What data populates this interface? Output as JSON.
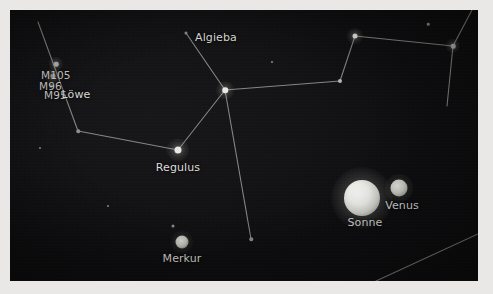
{
  "view": {
    "name": "star-chart",
    "panel": {
      "x": 10,
      "y": 10,
      "width": 468,
      "height": 271
    },
    "background_color": "#111112",
    "line_color": "#9a9a94",
    "label_color": "#dcdcd8",
    "margin_color": "#e9e8e6"
  },
  "labels": [
    {
      "id": "algieba",
      "text": "Algieba",
      "x": 206,
      "y": 22,
      "size": "normal"
    },
    {
      "id": "m105",
      "text": "M105",
      "x": 31,
      "y": 59,
      "size": "small"
    },
    {
      "id": "m96",
      "text": "M96",
      "x": 29,
      "y": 70,
      "size": "small"
    },
    {
      "id": "m95",
      "text": "M95",
      "x": 34,
      "y": 79,
      "size": "small"
    },
    {
      "id": "loewe",
      "text": "Löwe",
      "x": 66,
      "y": 79,
      "size": "normal"
    },
    {
      "id": "regulus",
      "text": "Regulus",
      "x": 168,
      "y": 152,
      "size": "normal"
    },
    {
      "id": "merkur",
      "text": "Merkur",
      "x": 172,
      "y": 243,
      "size": "normal"
    },
    {
      "id": "sonne",
      "text": "Sonne",
      "x": 355,
      "y": 207,
      "size": "normal"
    },
    {
      "id": "venus",
      "text": "Venus",
      "x": 392,
      "y": 190,
      "size": "normal"
    }
  ],
  "objects": {
    "sun": {
      "name": "Sonne",
      "x": 352,
      "y": 188,
      "diameter": 36
    },
    "venus": {
      "name": "Venus",
      "x": 389,
      "y": 178,
      "diameter": 17
    },
    "mercury": {
      "name": "Merkur",
      "x": 172,
      "y": 232,
      "diameter": 13
    }
  },
  "stars": [
    {
      "id": "regulus",
      "x": 168,
      "y": 140,
      "size": 7,
      "class": ""
    },
    {
      "id": "algieba",
      "x": 215,
      "y": 80,
      "size": 5.5,
      "class": ""
    },
    {
      "id": "zosma",
      "x": 345,
      "y": 26,
      "size": 5,
      "class": ""
    },
    {
      "id": "denebola",
      "x": 443,
      "y": 36,
      "size": 4.5,
      "class": "dim"
    },
    {
      "id": "chort",
      "x": 330,
      "y": 71,
      "size": 4,
      "class": "dim"
    },
    {
      "id": "eta-leonis",
      "x": 176,
      "y": 23,
      "size": 3,
      "class": "faint"
    },
    {
      "id": "node-lower-left",
      "x": 68,
      "y": 121,
      "size": 3.5,
      "class": "faint"
    },
    {
      "id": "node-lower-mid",
      "x": 241,
      "y": 229,
      "size": 3.5,
      "class": "faint"
    },
    {
      "id": "m105-dot",
      "x": 46,
      "y": 54,
      "size": 4.5,
      "class": "dim"
    },
    {
      "id": "m96-dot",
      "x": 43,
      "y": 66,
      "size": 5,
      "class": "dim"
    },
    {
      "id": "m95-dot",
      "x": 41,
      "y": 76,
      "size": 4,
      "class": "faint"
    },
    {
      "id": "star-near-mercury",
      "x": 163,
      "y": 216,
      "size": 3,
      "class": "faint"
    },
    {
      "id": "star-top-right",
      "x": 418,
      "y": 14,
      "size": 2.5,
      "class": "faint"
    },
    {
      "id": "star-mid-left",
      "x": 30,
      "y": 138,
      "size": 2,
      "class": "faint"
    },
    {
      "id": "star-lower-left",
      "x": 98,
      "y": 196,
      "size": 2,
      "class": "faint"
    },
    {
      "id": "star-upper-mid",
      "x": 262,
      "y": 52,
      "size": 2,
      "class": "faint"
    }
  ],
  "constellation_lines": [
    {
      "id": "line-topleft-to-node",
      "x1": 28,
      "y1": 12,
      "x2": 68,
      "y2": 121
    },
    {
      "id": "line-node-to-regulus",
      "x1": 68,
      "y1": 121,
      "x2": 168,
      "y2": 140
    },
    {
      "id": "line-regulus-to-algieba",
      "x1": 168,
      "y1": 140,
      "x2": 215,
      "y2": 80
    },
    {
      "id": "line-algieba-to-eta",
      "x1": 215,
      "y1": 80,
      "x2": 176,
      "y2": 23
    },
    {
      "id": "line-algieba-to-chort",
      "x1": 215,
      "y1": 80,
      "x2": 330,
      "y2": 71
    },
    {
      "id": "line-algieba-to-lower",
      "x1": 215,
      "y1": 80,
      "x2": 241,
      "y2": 229
    },
    {
      "id": "line-chort-to-zosma",
      "x1": 330,
      "y1": 71,
      "x2": 345,
      "y2": 26
    },
    {
      "id": "line-zosma-to-denebola",
      "x1": 345,
      "y1": 26,
      "x2": 443,
      "y2": 36
    },
    {
      "id": "line-denebola-up",
      "x1": 443,
      "y1": 36,
      "x2": 462,
      "y2": 0
    },
    {
      "id": "line-denebola-down",
      "x1": 443,
      "y1": 36,
      "x2": 437,
      "y2": 96
    },
    {
      "id": "line-corner-diagonal",
      "x1": 366,
      "y1": 271,
      "x2": 468,
      "y2": 224
    }
  ]
}
